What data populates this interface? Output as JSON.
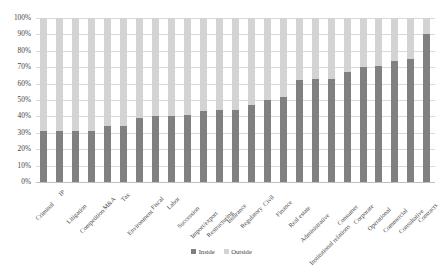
{
  "chart_data": {
    "type": "bar",
    "stacked": true,
    "title": "",
    "subtitle": "",
    "xlabel": "",
    "ylabel": "",
    "ylim": [
      0,
      100
    ],
    "ytick_labels": [
      "100%",
      "90%",
      "80%",
      "70%",
      "60%",
      "50%",
      "40%",
      "30%",
      "20%",
      "10%",
      "0%"
    ],
    "ytick_values": [
      100,
      90,
      80,
      70,
      60,
      50,
      40,
      30,
      20,
      10,
      0
    ],
    "grid": true,
    "legend_position": "bottom",
    "categories": [
      "Criminal",
      "IP",
      "Litigation",
      "Competition",
      "M&A",
      "Tax",
      "Environment",
      "Fiscal",
      "Labor",
      "Succession",
      "Import/export",
      "Restructuring",
      "Insurance",
      "Regulatory",
      "Civil",
      "Finance",
      "Real estate",
      "Administrative",
      "Institutional relations",
      "Consumer",
      "Corporate",
      "Operational",
      "Commercial",
      "Consultative",
      "Contracts"
    ],
    "series": [
      {
        "name": "Inside",
        "color": "#808080",
        "values": [
          31,
          31,
          31,
          31,
          34,
          34,
          39,
          40,
          40,
          41,
          43,
          44,
          44,
          47,
          50,
          52,
          62,
          63,
          63,
          67,
          70,
          71,
          74,
          75,
          90
        ]
      },
      {
        "name": "Outside",
        "color": "#d3d3d3",
        "values": [
          69,
          69,
          69,
          69,
          66,
          66,
          61,
          60,
          60,
          59,
          57,
          56,
          56,
          53,
          50,
          48,
          38,
          37,
          37,
          33,
          30,
          29,
          26,
          25,
          10
        ]
      }
    ]
  },
  "legend": {
    "items": [
      {
        "label": "Inside",
        "color": "#808080"
      },
      {
        "label": "Outside",
        "color": "#d3d3d3"
      }
    ]
  }
}
